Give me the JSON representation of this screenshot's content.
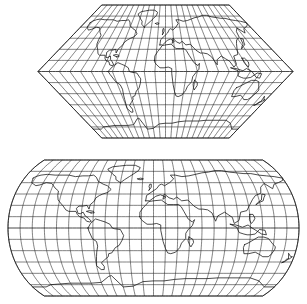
{
  "figure": {
    "background_color": "#ffffff",
    "line_color": "#1a1a1a",
    "coast_color": "#111111",
    "width_px": 307,
    "height_px": 304,
    "panel_count": 2
  },
  "panels": [
    {
      "id": "map-top",
      "name": "Eckert I projection",
      "projection_family": "pseudocylindrical",
      "outline_shape": "hexagon",
      "meridian_style": "straight-rectilinear",
      "parallel_style": "straight-horizontal",
      "pole_line_ratio": 0.5,
      "central_meridian_deg": 0,
      "graticule_interval_deg": 15,
      "meridian_count": 25,
      "parallel_count": 13,
      "lat_range_deg": [
        -90,
        90
      ],
      "lon_range_deg": [
        -180,
        180
      ],
      "bounds_px": {
        "x": 38,
        "y": 5,
        "width": 255,
        "height": 133
      },
      "equator_y_px": 71.5,
      "apex_left_px": 38,
      "apex_right_px": 293,
      "pole_left_px": 70,
      "pole_right_px": 261
    },
    {
      "id": "map-bottom",
      "name": "Eckert III projection",
      "projection_family": "pseudocylindrical",
      "outline_shape": "ellipse-with-flattened-poles",
      "meridian_style": "elliptical-arcs",
      "parallel_style": "straight-horizontal",
      "pole_line_ratio": 0.5,
      "central_meridian_deg": 0,
      "graticule_interval_deg": 15,
      "meridian_count": 25,
      "parallel_count": 13,
      "lat_range_deg": [
        -90,
        90
      ],
      "lon_range_deg": [
        -180,
        180
      ],
      "bounds_px": {
        "x": 8,
        "y": 160,
        "width": 291,
        "height": 136
      },
      "equator_y_px": 228,
      "pole_half_width_px": 72.75
    }
  ],
  "graticule": {
    "meridian_labels_deg": [
      -180,
      -165,
      -150,
      -135,
      -120,
      -105,
      -90,
      -75,
      -60,
      -45,
      -30,
      -15,
      0,
      15,
      30,
      45,
      60,
      75,
      90,
      105,
      120,
      135,
      150,
      165,
      180
    ],
    "parallel_labels_deg": [
      90,
      75,
      60,
      45,
      30,
      15,
      0,
      -15,
      -30,
      -45,
      -60,
      -75,
      -90
    ]
  },
  "landmasses": [
    "North America",
    "South America",
    "Greenland",
    "Eurasia",
    "Africa",
    "Australia",
    "Antarctica",
    "Indonesia",
    "Japan",
    "Madagascar",
    "British Isles",
    "New Zealand",
    "Iceland",
    "Philippines",
    "Caribbean"
  ],
  "chart_data": {
    "type": "map",
    "projections": [
      "Eckert I",
      "Eckert III"
    ],
    "graticule_interval_deg": 15,
    "central_meridian_deg": 0,
    "legend": [],
    "grid": true
  }
}
